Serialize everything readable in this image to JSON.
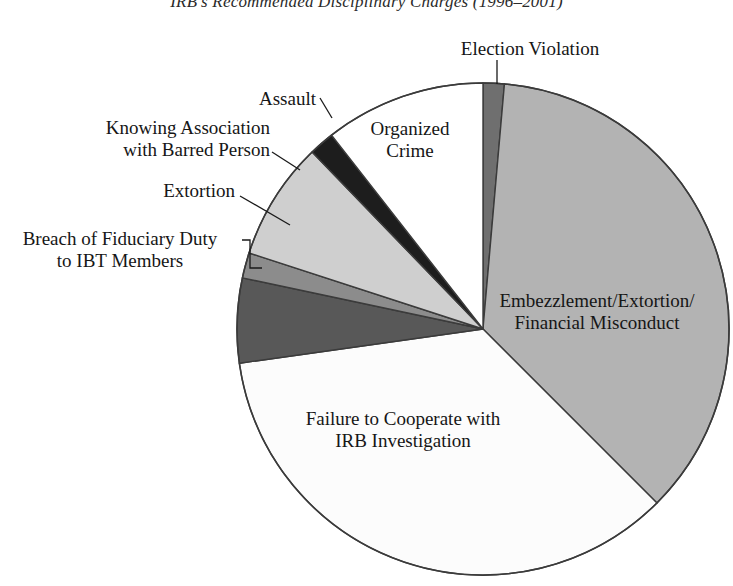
{
  "chart_data": {
    "type": "pie",
    "title": "IRB's Recommended Disciplinary Charges (1996–2001)",
    "xlabel": "",
    "ylabel": "",
    "legend_position": "none",
    "grid": false,
    "units": "percent of recommended charges",
    "start_angle_deg": 0,
    "direction": "clockwise",
    "categories": [
      "Election Violation",
      "Embezzlement/Extortion/ Financial Misconduct",
      "Failure to Cooperate with IRB Investigation",
      "Breach of Fiduciary Duty to IBT Members",
      "Extortion",
      "Knowing Association with Barred Person",
      "Assault",
      "Organized Crime"
    ],
    "values": [
      1.4,
      36.1,
      35.3,
      5.6,
      1.7,
      7.8,
      1.7,
      10.4
    ],
    "slices": [
      {
        "name": "Election Violation",
        "label_line1": "Election Violation",
        "label_line2": "",
        "value": 1.4,
        "start_deg": 0,
        "end_deg": 5,
        "color": "#6f6f6f",
        "label_type": "callout"
      },
      {
        "name": "Embezzlement/Extortion/Financial Misconduct",
        "label_line1": "Embezzlement/Extortion/",
        "label_line2": "Financial Misconduct",
        "value": 36.1,
        "start_deg": 5,
        "end_deg": 135,
        "color": "#b3b3b3",
        "label_type": "inside"
      },
      {
        "name": "Failure to Cooperate with IRB Investigation",
        "label_line1": "Failure to Cooperate with",
        "label_line2": "IRB Investigation",
        "value": 35.3,
        "start_deg": 135,
        "end_deg": 262,
        "color": "#fcfcfc",
        "label_type": "inside"
      },
      {
        "name": "Breach of Fiduciary Duty to IBT Members",
        "label_line1": "Breach of Fiduciary Duty",
        "label_line2": "to IBT Members",
        "value": 5.6,
        "start_deg": 262,
        "end_deg": 282,
        "color": "#585858",
        "label_type": "callout"
      },
      {
        "name": "Extortion",
        "label_line1": "Extortion",
        "label_line2": "",
        "value": 1.7,
        "start_deg": 282,
        "end_deg": 288,
        "color": "#8c8c8c",
        "label_type": "callout"
      },
      {
        "name": "Knowing Association with Barred Person",
        "label_line1": "Knowing Association",
        "label_line2": "with Barred Person",
        "value": 7.8,
        "start_deg": 288,
        "end_deg": 316,
        "color": "#cfcfcf",
        "label_type": "callout"
      },
      {
        "name": "Assault",
        "label_line1": "Assault",
        "label_line2": "",
        "value": 1.7,
        "start_deg": 316,
        "end_deg": 322,
        "color": "#1d1d1d",
        "label_type": "callout"
      },
      {
        "name": "Organized Crime",
        "label_line1": "Organized",
        "label_line2": "Crime",
        "value": 10.4,
        "start_deg": 322,
        "end_deg": 360,
        "color": "#ffffff",
        "label_type": "inside"
      }
    ],
    "geometry": {
      "center_x": 483,
      "center_y": 329,
      "radius": 246,
      "outline_color": "#3b3b3b"
    }
  }
}
